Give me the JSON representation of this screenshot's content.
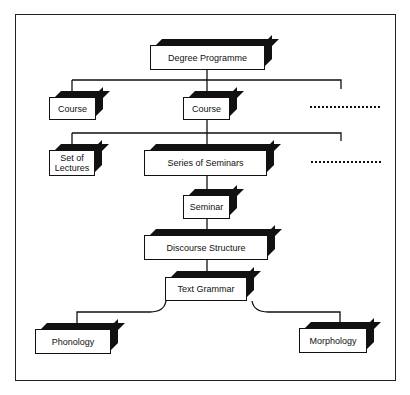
{
  "diagram": {
    "type": "hierarchy",
    "nodes": {
      "degree_programme": "Degree Programme",
      "course_left": "Course",
      "course_center": "Course",
      "set_of_lectures": "Set of Lectures",
      "series_of_seminars": "Series of Seminars",
      "seminar": "Seminar",
      "discourse_structure": "Discourse Structure",
      "text_grammar": "Text Grammar",
      "phonology": "Phonology",
      "morphology": "Morphology"
    },
    "ellipsis_rows": [
      "more courses (dotted)",
      "more course components (dotted)"
    ],
    "edges": [
      [
        "Degree Programme",
        "Course"
      ],
      [
        "Degree Programme",
        "Course"
      ],
      [
        "Degree Programme",
        "..."
      ],
      [
        "Course",
        "Set of Lectures"
      ],
      [
        "Course",
        "Series of Seminars"
      ],
      [
        "Course",
        "..."
      ],
      [
        "Series of Seminars",
        "Seminar"
      ],
      [
        "Seminar",
        "Discourse Structure"
      ],
      [
        "Discourse Structure",
        "Text Grammar"
      ],
      [
        "Text Grammar",
        "Phonology"
      ],
      [
        "Text Grammar",
        "Morphology"
      ]
    ]
  }
}
